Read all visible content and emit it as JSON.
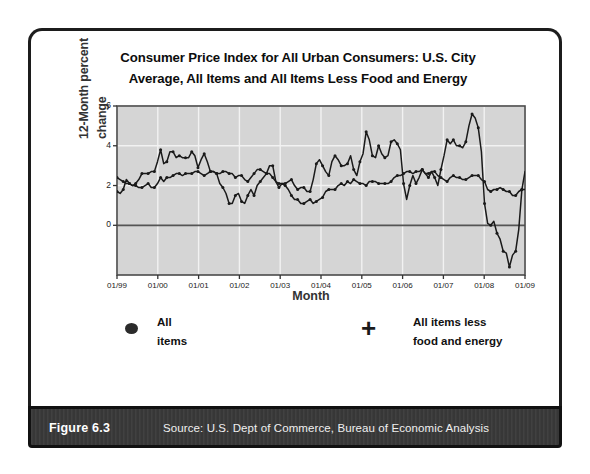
{
  "figure": {
    "label": "Figure 6.3",
    "source": "Source:  U.S. Dept of Commerce, Bureau of Economic Analysis"
  },
  "chart_data": {
    "type": "line",
    "title": "Consumer Price Index for All Urban Consumers: U.S. City Average, All Items and All Items Less Food and Energy",
    "title_line1": "Consumer Price Index for All Urban Consumers: U.S. City",
    "title_line2": "Average, All Items and All Items Less Food and Energy",
    "xlabel": "Month",
    "ylabel": "12-Month percent change",
    "ylabel_line1": "12-Month percent",
    "ylabel_line2": "change",
    "ylim": [
      -2.5,
      6
    ],
    "yticks": [
      0,
      2,
      4,
      6
    ],
    "ytick_labels": [
      "0",
      "2",
      "4",
      "6"
    ],
    "xticks": [
      "01/99",
      "01/00",
      "01/01",
      "01/02",
      "01/03",
      "01/04",
      "01/05",
      "01/06",
      "01/07",
      "01/08",
      "01/09"
    ],
    "grid": true,
    "plot_bgcolor": "#d5d5d5",
    "gridcolor": "#f2f2f2",
    "zero_line": 0,
    "legend_position": "below-plot",
    "series": [
      {
        "name": "All items",
        "marker": "dot",
        "color": "#1a1a1a",
        "values": [
          1.7,
          1.6,
          1.8,
          2.3,
          2.1,
          2.0,
          2.1,
          2.3,
          2.6,
          2.6,
          2.6,
          2.7,
          2.7,
          3.2,
          3.8,
          3.1,
          3.2,
          3.7,
          3.7,
          3.4,
          3.5,
          3.4,
          3.4,
          3.4,
          3.7,
          3.5,
          2.9,
          3.3,
          3.6,
          3.2,
          2.7,
          2.7,
          2.6,
          2.1,
          1.9,
          1.6,
          1.1,
          1.1,
          1.5,
          1.6,
          1.2,
          1.1,
          1.5,
          1.8,
          1.5,
          2.0,
          2.2,
          2.4,
          2.6,
          3.0,
          3.0,
          2.2,
          2.1,
          2.1,
          2.1,
          2.2,
          2.3,
          2.0,
          1.8,
          1.9,
          1.9,
          1.7,
          1.7,
          2.3,
          3.1,
          3.3,
          3.0,
          2.7,
          2.5,
          3.2,
          3.5,
          3.3,
          3.0,
          3.0,
          3.1,
          3.5,
          2.8,
          2.5,
          3.2,
          3.6,
          4.7,
          4.3,
          3.5,
          3.4,
          4.0,
          3.6,
          3.4,
          3.5,
          4.2,
          4.3,
          4.1,
          3.8,
          2.1,
          1.3,
          2.0,
          2.5,
          2.1,
          2.4,
          2.8,
          2.6,
          2.4,
          2.7,
          2.4,
          2.0,
          2.8,
          3.5,
          4.3,
          4.1,
          4.3,
          4.0,
          4.0,
          3.9,
          4.2,
          5.0,
          5.6,
          5.4,
          4.9,
          3.7,
          1.1,
          0.1,
          0.0,
          0.2,
          -0.4,
          -0.7,
          -1.3,
          -1.4,
          -2.1,
          -1.5,
          -1.3,
          -0.2,
          1.8,
          2.7
        ]
      },
      {
        "name": "All items less food and energy",
        "marker": "plus",
        "color": "#1a1a1a",
        "values": [
          2.4,
          2.3,
          2.2,
          2.1,
          2.1,
          2.0,
          2.0,
          1.9,
          1.9,
          2.0,
          2.1,
          1.9,
          1.9,
          2.1,
          2.4,
          2.2,
          2.4,
          2.4,
          2.5,
          2.6,
          2.6,
          2.5,
          2.6,
          2.6,
          2.6,
          2.7,
          2.7,
          2.6,
          2.5,
          2.6,
          2.7,
          2.7,
          2.6,
          2.6,
          2.7,
          2.7,
          2.6,
          2.6,
          2.4,
          2.5,
          2.5,
          2.3,
          2.2,
          2.4,
          2.6,
          2.8,
          2.8,
          2.7,
          2.6,
          2.6,
          2.4,
          2.2,
          1.9,
          2.1,
          2.0,
          1.8,
          1.5,
          1.3,
          1.3,
          1.1,
          1.1,
          1.2,
          1.3,
          1.1,
          1.2,
          1.3,
          1.4,
          1.7,
          1.8,
          1.8,
          1.8,
          2.0,
          2.1,
          2.0,
          2.2,
          2.1,
          2.3,
          2.2,
          2.1,
          2.1,
          2.0,
          2.2,
          2.2,
          2.2,
          2.1,
          2.1,
          2.1,
          2.1,
          2.2,
          2.4,
          2.5,
          2.5,
          2.6,
          2.7,
          2.7,
          2.6,
          2.7,
          2.7,
          2.8,
          2.6,
          2.6,
          2.7,
          2.7,
          2.5,
          2.4,
          2.3,
          2.2,
          2.4,
          2.5,
          2.4,
          2.4,
          2.3,
          2.3,
          2.4,
          2.5,
          2.5,
          2.5,
          2.3,
          2.2,
          1.8,
          1.7,
          1.8,
          1.8,
          1.9,
          1.8,
          1.7,
          1.7,
          1.5,
          1.5,
          1.7,
          1.8,
          1.8
        ]
      }
    ]
  },
  "legend": {
    "items": [
      {
        "marker": "dot",
        "line1": "All",
        "line2": "items"
      },
      {
        "marker": "plus",
        "line1": "All items less",
        "line2": "food and energy"
      }
    ]
  }
}
